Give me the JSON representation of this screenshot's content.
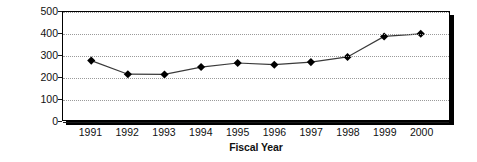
{
  "chart_data": {
    "type": "line",
    "title": "",
    "subtitle": "",
    "xlabel": "Fiscal Year",
    "ylabel": "Dollars (millions)",
    "categories": [
      "1991",
      "1992",
      "1993",
      "1994",
      "1995",
      "1996",
      "1997",
      "1998",
      "1999",
      "2000"
    ],
    "values": [
      275,
      212,
      211,
      245,
      264,
      256,
      268,
      292,
      387,
      399
    ],
    "series": [
      {
        "name": "Dollars (millions)",
        "values": [
          275,
          212,
          211,
          245,
          264,
          256,
          268,
          292,
          387,
          399
        ]
      }
    ],
    "ylim": [
      0,
      500
    ],
    "yticks": [
      0,
      100,
      200,
      300,
      400,
      500
    ],
    "ytick_labels": [
      "0",
      "100",
      "200",
      "300",
      "400",
      "500"
    ],
    "grid": true,
    "grid_axis": "y",
    "grid_style": "dotted",
    "legend": false,
    "legend_position": "none",
    "marker": "diamond",
    "annotations": [],
    "colors": {
      "line": "#3a3a3a",
      "marker": "#000000",
      "grid": "#9a9a9a",
      "frame": "#000000",
      "text": "#111111",
      "background": "#ffffff"
    }
  }
}
